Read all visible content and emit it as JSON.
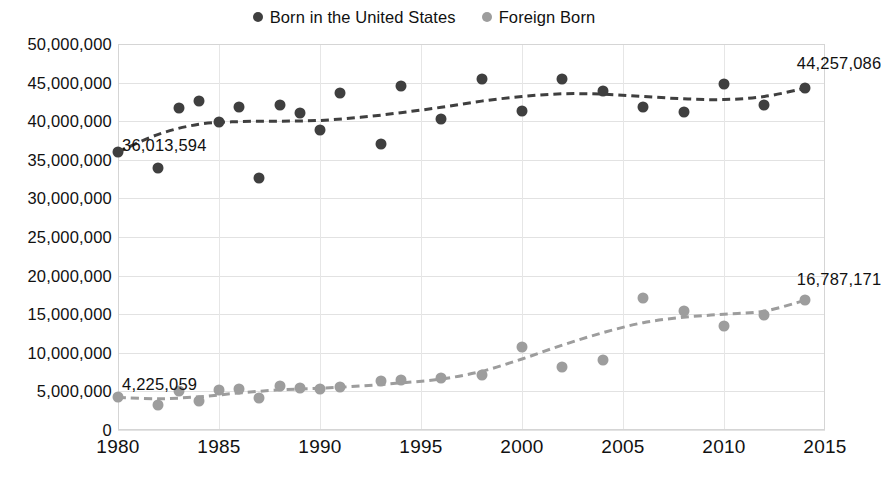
{
  "legend": {
    "position": "top-center",
    "items": [
      {
        "label": "Born in the United States",
        "color": "#3f3f3f",
        "marker": "circle"
      },
      {
        "label": "Foreign Born",
        "color": "#9d9d9d",
        "marker": "circle"
      }
    ]
  },
  "axes": {
    "y_ticks": [
      "0",
      "5,000,000",
      "10,000,000",
      "15,000,000",
      "20,000,000",
      "25,000,000",
      "30,000,000",
      "35,000,000",
      "40,000,000",
      "45,000,000",
      "50,000,000"
    ],
    "x_ticks": [
      "1980",
      "1985",
      "1990",
      "1995",
      "2000",
      "2005",
      "2010",
      "2015"
    ]
  },
  "annotations": [
    {
      "text": "36,013,594",
      "series": "Born in the United States",
      "year": 1980
    },
    {
      "text": "44,257,086",
      "series": "Born in the United States",
      "year": 2014
    },
    {
      "text": "4,225,059",
      "series": "Foreign Born",
      "year": 1980
    },
    {
      "text": "16,787,171",
      "series": "Foreign Born",
      "year": 2014
    }
  ],
  "chart_data": {
    "type": "scatter",
    "title": "",
    "subtitle": "",
    "xlabel": "",
    "ylabel": "",
    "xlim": [
      1980,
      2015
    ],
    "ylim": [
      0,
      50000000
    ],
    "ytick_step": 5000000,
    "xtick_step": 5,
    "grid": true,
    "legend_position": "top-center",
    "trendlines": "dashed, one per series",
    "series": [
      {
        "name": "Born in the United States",
        "color": "#3f3f3f",
        "marker": "circle",
        "points": [
          {
            "x": 1980,
            "y": 36013594
          },
          {
            "x": 1982,
            "y": 34000000
          },
          {
            "x": 1983,
            "y": 41700000
          },
          {
            "x": 1984,
            "y": 42600000
          },
          {
            "x": 1985,
            "y": 39900000
          },
          {
            "x": 1986,
            "y": 41900000
          },
          {
            "x": 1987,
            "y": 32600000
          },
          {
            "x": 1988,
            "y": 42100000
          },
          {
            "x": 1989,
            "y": 41000000
          },
          {
            "x": 1990,
            "y": 38900000
          },
          {
            "x": 1991,
            "y": 43600000
          },
          {
            "x": 1993,
            "y": 37000000
          },
          {
            "x": 1994,
            "y": 44500000
          },
          {
            "x": 1996,
            "y": 40300000
          },
          {
            "x": 1998,
            "y": 45500000
          },
          {
            "x": 2000,
            "y": 41300000
          },
          {
            "x": 2002,
            "y": 45500000
          },
          {
            "x": 2004,
            "y": 43900000
          },
          {
            "x": 2006,
            "y": 41900000
          },
          {
            "x": 2008,
            "y": 41200000
          },
          {
            "x": 2010,
            "y": 44800000
          },
          {
            "x": 2012,
            "y": 42100000
          },
          {
            "x": 2014,
            "y": 44257086
          }
        ],
        "trend": [
          {
            "x": 1980,
            "y": 36013594
          },
          {
            "x": 1982,
            "y": 38300000
          },
          {
            "x": 1984,
            "y": 39600000
          },
          {
            "x": 1986,
            "y": 39950000
          },
          {
            "x": 1988,
            "y": 40000000
          },
          {
            "x": 1990,
            "y": 40100000
          },
          {
            "x": 1992,
            "y": 40500000
          },
          {
            "x": 1994,
            "y": 41100000
          },
          {
            "x": 1996,
            "y": 41800000
          },
          {
            "x": 1998,
            "y": 42600000
          },
          {
            "x": 2000,
            "y": 43200000
          },
          {
            "x": 2002,
            "y": 43550000
          },
          {
            "x": 2004,
            "y": 43500000
          },
          {
            "x": 2006,
            "y": 43200000
          },
          {
            "x": 2008,
            "y": 42900000
          },
          {
            "x": 2010,
            "y": 42800000
          },
          {
            "x": 2012,
            "y": 43200000
          },
          {
            "x": 2014,
            "y": 44257086
          }
        ]
      },
      {
        "name": "Foreign Born",
        "color": "#9d9d9d",
        "marker": "circle",
        "points": [
          {
            "x": 1980,
            "y": 4225059
          },
          {
            "x": 1982,
            "y": 3300000
          },
          {
            "x": 1983,
            "y": 5100000
          },
          {
            "x": 1984,
            "y": 3700000
          },
          {
            "x": 1985,
            "y": 5200000
          },
          {
            "x": 1986,
            "y": 5300000
          },
          {
            "x": 1987,
            "y": 4200000
          },
          {
            "x": 1988,
            "y": 5700000
          },
          {
            "x": 1989,
            "y": 5500000
          },
          {
            "x": 1990,
            "y": 5300000
          },
          {
            "x": 1991,
            "y": 5600000
          },
          {
            "x": 1993,
            "y": 6400000
          },
          {
            "x": 1994,
            "y": 6500000
          },
          {
            "x": 1996,
            "y": 6700000
          },
          {
            "x": 1998,
            "y": 7100000
          },
          {
            "x": 2000,
            "y": 10800000
          },
          {
            "x": 2002,
            "y": 8200000
          },
          {
            "x": 2004,
            "y": 9100000
          },
          {
            "x": 2006,
            "y": 17100000
          },
          {
            "x": 2008,
            "y": 15400000
          },
          {
            "x": 2010,
            "y": 13500000
          },
          {
            "x": 2012,
            "y": 14900000
          },
          {
            "x": 2014,
            "y": 16787171
          }
        ],
        "trend": [
          {
            "x": 1980,
            "y": 4225059
          },
          {
            "x": 1982,
            "y": 4050000
          },
          {
            "x": 1984,
            "y": 4300000
          },
          {
            "x": 1986,
            "y": 4800000
          },
          {
            "x": 1988,
            "y": 5200000
          },
          {
            "x": 1990,
            "y": 5400000
          },
          {
            "x": 1992,
            "y": 5700000
          },
          {
            "x": 1994,
            "y": 6100000
          },
          {
            "x": 1996,
            "y": 6600000
          },
          {
            "x": 1998,
            "y": 7600000
          },
          {
            "x": 2000,
            "y": 9200000
          },
          {
            "x": 2002,
            "y": 11000000
          },
          {
            "x": 2004,
            "y": 12600000
          },
          {
            "x": 2006,
            "y": 13900000
          },
          {
            "x": 2008,
            "y": 14600000
          },
          {
            "x": 2010,
            "y": 15000000
          },
          {
            "x": 2012,
            "y": 15400000
          },
          {
            "x": 2014,
            "y": 16787171
          }
        ]
      }
    ]
  }
}
